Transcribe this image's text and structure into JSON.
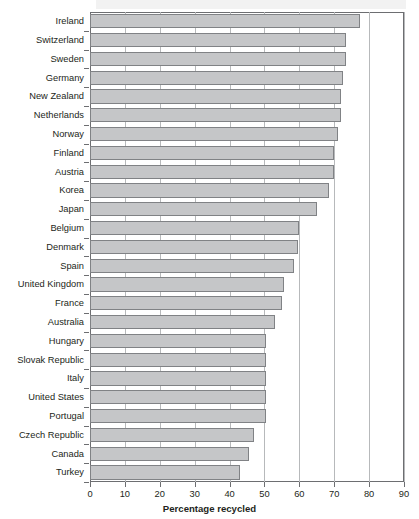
{
  "chart_data": {
    "type": "bar",
    "orientation": "horizontal",
    "title": "",
    "subtitle": "",
    "xlabel": "Percentage recycled",
    "ylabel": "",
    "xlim": [
      0,
      90
    ],
    "ylim": null,
    "grid": true,
    "gridlines_axis": "x",
    "legend": null,
    "legend_position": "none",
    "xticks": [
      0,
      10,
      20,
      30,
      40,
      50,
      60,
      70,
      80,
      90
    ],
    "xtick_labels": [
      "0",
      "10",
      "20",
      "30",
      "40",
      "50",
      "60",
      "70",
      "80",
      "90"
    ],
    "bar_fill_color": "#c5c6c8",
    "bar_edge_color": "#808285",
    "categories": [
      "Ireland",
      "Switzerland",
      "Sweden",
      "Germany",
      "New Zealand",
      "Netherlands",
      "Norway",
      "Finland",
      "Austria",
      "Korea",
      "Japan",
      "Belgium",
      "Denmark",
      "Spain",
      "United Kingdom",
      "France",
      "Australia",
      "Hungary",
      "Slovak Republic",
      "Italy",
      "United States",
      "Portugal",
      "Czech Republic",
      "Canada",
      "Turkey"
    ],
    "values": [
      77.5,
      73.5,
      73.5,
      72.5,
      72,
      72,
      71,
      70,
      70,
      68.5,
      65,
      60,
      59.5,
      58.5,
      55.5,
      55,
      53,
      50.5,
      50.5,
      50.5,
      50.5,
      50.5,
      47,
      45.5,
      43
    ]
  }
}
